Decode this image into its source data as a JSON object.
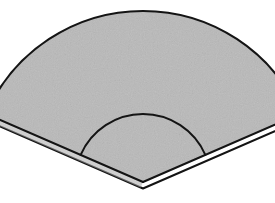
{
  "figure": {
    "description": "A shaded circular sector (pie wedge) drawn in pictorial 3D as a thin slab, with a concentric inner arc near the apex and an offset duplicate outline below indicating thickness.",
    "canvas": {
      "width": 275,
      "height": 203
    },
    "colors": {
      "background": "#ffffff",
      "fill": "#b9b9b9",
      "fill_shadow": "#a8a8a8",
      "outline": "#141414",
      "edge_white": "#fdfdfd"
    },
    "style": {
      "outline_width": 2.1,
      "inner_arc_width": 2.0,
      "texture": "fine-grain speckle"
    },
    "geometry": {
      "apex": {
        "x": 143,
        "y": 182
      },
      "outer_radius": 171,
      "inner_radius": 68,
      "start_angle_deg": 203.5,
      "end_angle_deg": 336.5,
      "sweep_deg": 133,
      "thickness_offset": {
        "dx": 0,
        "dy": 6.5
      },
      "outer_left_tip": {
        "x": 26,
        "y": 62
      },
      "outer_right_tip": {
        "x": 252,
        "y": 55
      },
      "outer_arc_apex": {
        "x": 146,
        "y": 13
      },
      "inner_left_point": {
        "x": 97,
        "y": 122
      },
      "inner_right_point": {
        "x": 190,
        "y": 122
      },
      "inner_arc_apex": {
        "x": 143,
        "y": 113
      }
    },
    "parts": [
      {
        "name": "bottom-slab-face",
        "role": "thickness / underside silhouette"
      },
      {
        "name": "top-sector-face",
        "role": "shaded upper face of the wedge"
      },
      {
        "name": "inner-arc",
        "role": "concentric arc cut near the apex"
      },
      {
        "name": "left-radius-edge",
        "role": "straight radial edge, left"
      },
      {
        "name": "right-radius-edge",
        "role": "straight radial edge, right"
      },
      {
        "name": "outer-arc-edge",
        "role": "outer circular boundary"
      }
    ]
  }
}
